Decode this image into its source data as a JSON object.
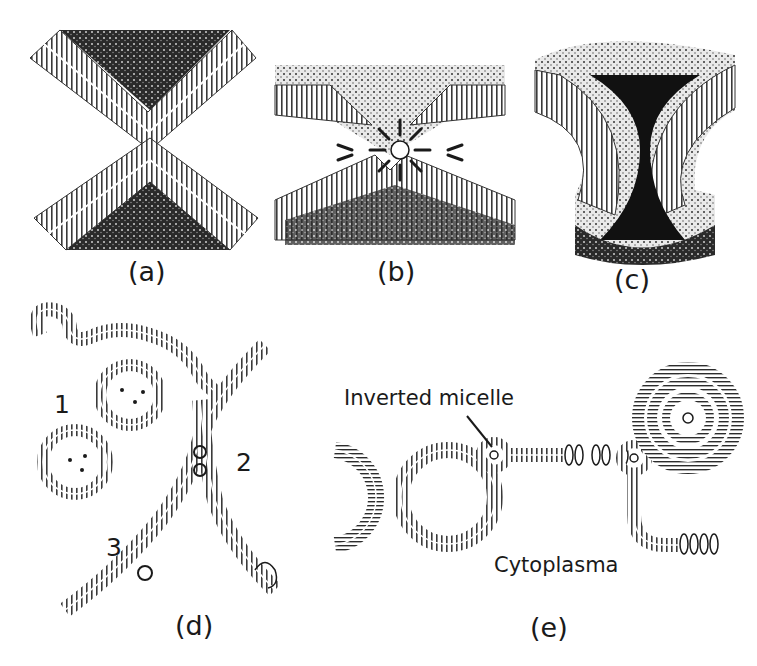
{
  "figure": {
    "colors": {
      "ink": "#1a1a1a",
      "background": "#ffffff",
      "dark_fill": "#111111",
      "membrane_gray": "#8a8a8a"
    },
    "panels": [
      {
        "id": "a",
        "label": "(a)",
        "content": "Two opposed curved bilayers approaching (point contact)"
      },
      {
        "id": "b",
        "label": "(b)",
        "content": "Inverted micelle between two bilayers"
      },
      {
        "id": "c",
        "label": "(c)",
        "content": "Stalk / hemifusion intermediate"
      },
      {
        "id": "d",
        "label": "(d)",
        "content": "Membrane fusion events",
        "numbers": [
          "1",
          "2",
          "3"
        ]
      },
      {
        "id": "e",
        "label": "(e)",
        "content": "Inverted micelle intermediates in membrane fusion",
        "annotations": {
          "inverted_micelle": "Inverted micelle",
          "cytoplasma": "Cytoplasma"
        }
      }
    ]
  }
}
